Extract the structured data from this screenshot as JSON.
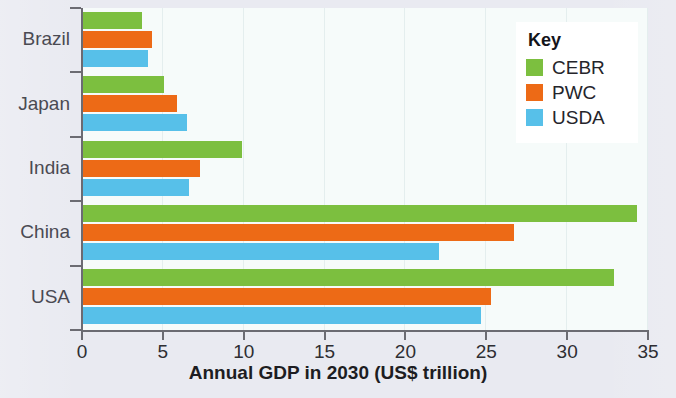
{
  "chart_data": {
    "type": "bar",
    "orientation": "horizontal",
    "title": "",
    "xlabel": "Annual GDP in 2030 (US$ trillion)",
    "ylabel": "",
    "categories": [
      "Brazil",
      "Japan",
      "India",
      "China",
      "USA"
    ],
    "series": [
      {
        "name": "CEBR",
        "color": "#7cbf3f",
        "values": [
          3.7,
          5.1,
          9.9,
          34.3,
          32.9
        ]
      },
      {
        "name": "PWC",
        "color": "#ed6a16",
        "values": [
          4.3,
          5.9,
          7.3,
          26.7,
          25.3
        ]
      },
      {
        "name": "USDA",
        "color": "#57c0e9",
        "values": [
          4.1,
          6.5,
          6.6,
          22.1,
          24.7
        ]
      }
    ],
    "xticks": [
      0,
      5,
      10,
      15,
      20,
      25,
      30,
      35
    ],
    "xtick_labels": [
      "0",
      "5",
      "10",
      "15",
      "20",
      "25",
      "30",
      "35"
    ],
    "xlim": [
      0,
      35
    ],
    "grid": true,
    "grid_axis": "x",
    "legend": {
      "title": "Key",
      "position": "top-right",
      "entries": [
        "CEBR",
        "PWC",
        "USDA"
      ]
    }
  },
  "legend": {
    "title": "Key",
    "items": [
      {
        "label": "CEBR",
        "color": "#7cbf3f"
      },
      {
        "label": "PWC",
        "color": "#ed6a16"
      },
      {
        "label": "USDA",
        "color": "#57c0e9"
      }
    ]
  },
  "axis": {
    "x_title": "Annual GDP in 2030 (US$ trillion)",
    "x_labels": [
      "0",
      "5",
      "10",
      "15",
      "20",
      "25",
      "30",
      "35"
    ],
    "y_labels": [
      "Brazil",
      "Japan",
      "India",
      "China",
      "USA"
    ]
  },
  "colors": {
    "cebr": "#7cbf3f",
    "pwc": "#ed6a16",
    "usda": "#57c0e9",
    "page_background": "#e9eaf1",
    "plot_background": "#f6fbfa",
    "axis": "#6b6b72"
  }
}
